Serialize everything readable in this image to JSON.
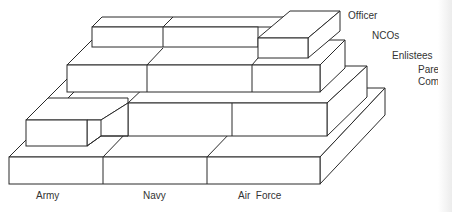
{
  "diagram": {
    "type": "stacked-3d-block-pyramid",
    "tiers": [
      {
        "id": "officer",
        "label": "Officer"
      },
      {
        "id": "ncos",
        "label": "NCOs"
      },
      {
        "id": "enlistees",
        "label": "Enlistees"
      },
      {
        "id": "parent-command",
        "label_line1": "Parer",
        "label_line2": "Com"
      }
    ],
    "services": [
      {
        "id": "army",
        "label": "Army"
      },
      {
        "id": "navy",
        "label": "Navy"
      },
      {
        "id": "air-force",
        "label": "Air  Force"
      }
    ],
    "colors": {
      "line": "#2a2a2a",
      "face": "#ffffff",
      "text": "#333333"
    }
  }
}
